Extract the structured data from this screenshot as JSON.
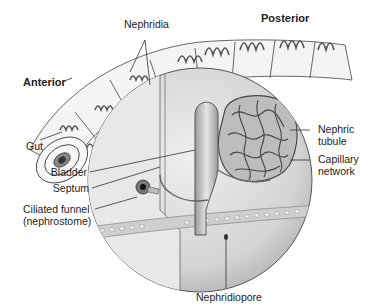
{
  "diagram": {
    "labels": {
      "nephridia": "Nephridia",
      "posterior": "Posterior",
      "anterior": "Anterior",
      "gut": "Gut",
      "nephric_tubule_1": "Nephric",
      "nephric_tubule_2": "tubule",
      "capillary_network_1": "Capillary",
      "capillary_network_2": "network",
      "bladder": "Bladder",
      "septum": "Septum",
      "ciliated_funnel_1": "Ciliated funnel",
      "ciliated_funnel_2": "(nephrostome)",
      "nephridiopore": "Nephridiopore"
    },
    "colors": {
      "line": "#333333",
      "tissue_light": "#e4e4e4",
      "tissue_mid": "#c8c8c8",
      "tissue_dark": "#9a9a9a"
    }
  }
}
